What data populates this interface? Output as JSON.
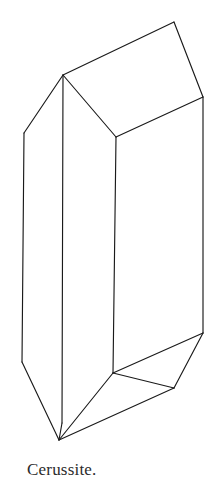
{
  "plate": {
    "background_color": "#ffffff",
    "stroke_color": "#1a1a1a",
    "width": 213,
    "height": 497
  },
  "caption": {
    "text": "Cerussite.",
    "color": "#2b2b2b"
  },
  "figure": {
    "view": "perspective",
    "vertices": {
      "top_apex_left": [
        63,
        75
      ],
      "top_peak_right": [
        174,
        22
      ],
      "top_right": [
        203,
        97
      ],
      "top_front_center": [
        116,
        137
      ],
      "left_shoulder": [
        24,
        133
      ],
      "left_edge_bottom_bend": [
        22,
        362
      ],
      "front_left_edge_bottom": [
        62,
        423
      ],
      "front_center_edge_bottom": [
        113,
        373
      ],
      "right_edge_bottom_bend": [
        203,
        333
      ],
      "bottom_right_vertex": [
        174,
        388
      ],
      "bottom_apex": [
        59,
        440
      ]
    },
    "edges": [
      "top_apex_left-top_peak_right",
      "top_peak_right-top_right",
      "top_right-top_front_center",
      "top_front_center-top_apex_left",
      "top_apex_left-left_shoulder",
      "left_shoulder-left_edge_bottom_bend",
      "left_edge_bottom_bend-bottom_apex",
      "top_apex_left-front_left_edge_bottom",
      "front_left_edge_bottom-bottom_apex",
      "top_front_center-front_center_edge_bottom",
      "front_center_edge_bottom-bottom_apex",
      "front_center_edge_bottom-bottom_right_vertex",
      "bottom_right_vertex-bottom_apex",
      "top_right-right_edge_bottom_bend",
      "right_edge_bottom_bend-bottom_right_vertex",
      "right_edge_bottom_bend-front_center_edge_bottom"
    ]
  }
}
